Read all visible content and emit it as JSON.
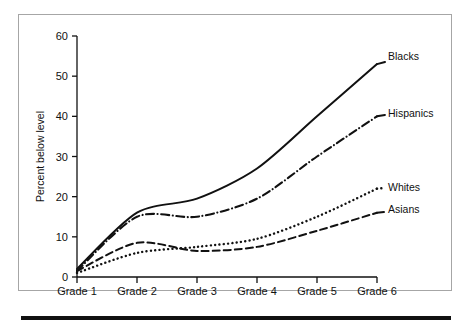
{
  "figure": {
    "background_color": "#ffffff",
    "frame_color": "#a6a6a6",
    "rule_color": "#111111",
    "ink_color": "#111111"
  },
  "chart_data": {
    "type": "line",
    "title": "",
    "subtitle": "",
    "xlabel": "",
    "ylabel": "Percent below level",
    "categories": [
      "Grade 1",
      "Grade 2",
      "Grade 3",
      "Grade 4",
      "Grade 5",
      "Grade 6"
    ],
    "x": [
      1,
      2,
      3,
      4,
      5,
      6
    ],
    "ylim": [
      0,
      60
    ],
    "xlim": [
      1,
      6
    ],
    "yticks": [
      0,
      10,
      20,
      30,
      40,
      50,
      60
    ],
    "ytick_labels": [
      "0",
      "10",
      "20",
      "30",
      "40",
      "50",
      "60"
    ],
    "xtick_labels": [
      "Grade 1",
      "Grade 2",
      "Grade 3",
      "Grade 4",
      "Grade 5",
      "Grade 6"
    ],
    "grid": false,
    "legend_position": "right-inline-labels",
    "series": [
      {
        "name": "Blacks",
        "style": "solid",
        "color": "#111111",
        "values": [
          2,
          16,
          19.5,
          27,
          40,
          53
        ]
      },
      {
        "name": "Hispanics",
        "style": "dash-dot",
        "color": "#111111",
        "values": [
          1.5,
          15,
          15,
          19.5,
          30,
          40
        ]
      },
      {
        "name": "Whites",
        "style": "dotted",
        "color": "#111111",
        "values": [
          1,
          6,
          7.5,
          9.5,
          15,
          22
        ]
      },
      {
        "name": "Asians",
        "style": "dashed",
        "color": "#111111",
        "values": [
          1.5,
          8.5,
          6.5,
          7.5,
          11.5,
          16
        ]
      }
    ]
  }
}
